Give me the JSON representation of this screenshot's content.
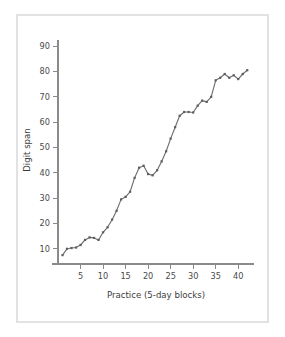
{
  "figure": {
    "frame_color": "#e2e2e2",
    "background": "#ffffff",
    "line_color": "#6f6f73",
    "axis_color": "#8a8a8a",
    "text_color": "#3c3c3c"
  },
  "chart_data": {
    "type": "line",
    "title": "",
    "xlabel": "Practice (5-day blocks)",
    "ylabel": "Digit span",
    "xlim": [
      0,
      43.5
    ],
    "ylim": [
      4,
      94
    ],
    "xticks": [
      5,
      10,
      15,
      20,
      25,
      30,
      35,
      40
    ],
    "xtick_labels": [
      "5",
      "10",
      "15",
      "20",
      "25",
      "30",
      "35",
      "40"
    ],
    "yticks": [
      10,
      20,
      30,
      40,
      50,
      60,
      70,
      80,
      90
    ],
    "ytick_labels": [
      "10",
      "20",
      "30",
      "40",
      "50",
      "60",
      "70",
      "80",
      "90"
    ],
    "grid": false,
    "legend": null,
    "marker": "square",
    "series": [
      {
        "name": "Digit span",
        "x": [
          1,
          2,
          3,
          4,
          5,
          6,
          7,
          8,
          9,
          10,
          11,
          12,
          13,
          14,
          15,
          16,
          17,
          18,
          19,
          20,
          21,
          22,
          23,
          24,
          25,
          26,
          27,
          28,
          29,
          30,
          31,
          32,
          33,
          34,
          35,
          36,
          37,
          38,
          39,
          40,
          41,
          42
        ],
        "values": [
          7.5,
          10.0,
          10.3,
          10.5,
          11.5,
          13.5,
          14.5,
          14.3,
          13.5,
          16.5,
          18.5,
          21.5,
          25.0,
          29.5,
          30.5,
          32.5,
          38.0,
          42.0,
          42.8,
          39.5,
          39.0,
          41.0,
          44.5,
          48.5,
          53.5,
          58.0,
          62.5,
          64.0,
          64.0,
          63.8,
          66.5,
          68.5,
          68.0,
          70.0,
          76.5,
          77.5,
          79.0,
          77.5,
          78.5,
          77.0,
          79.0,
          80.5
        ]
      }
    ]
  }
}
